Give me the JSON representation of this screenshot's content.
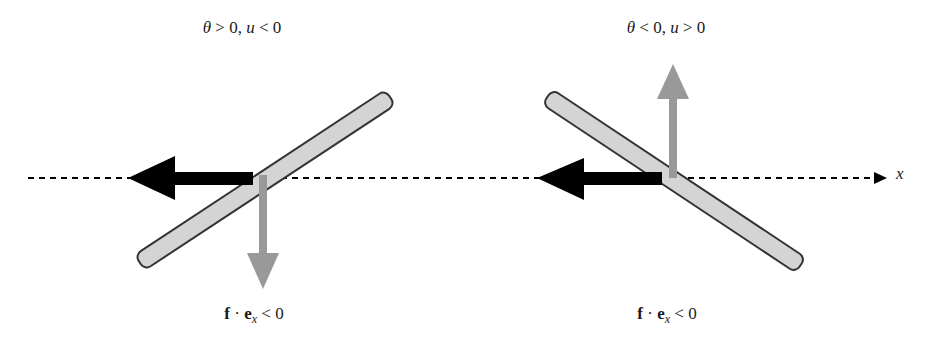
{
  "panels": [
    {
      "id": "left",
      "top_label": {
        "theta": "θ",
        "theta_rel": " > 0, ",
        "u": "u",
        "u_rel": " < 0"
      },
      "bottom_label": {
        "f": "f",
        "dot": " · ",
        "e": "e",
        "sub": "x",
        "rel": " < 0"
      }
    },
    {
      "id": "right",
      "top_label": {
        "theta": "θ",
        "theta_rel": " < 0, ",
        "u": "u",
        "u_rel": " > 0"
      },
      "bottom_label": {
        "f": "f",
        "dot": " · ",
        "e": "e",
        "sub": "x",
        "rel": " < 0"
      }
    }
  ],
  "axis": {
    "label": "x"
  },
  "colors": {
    "plate_fill": "#d4d4d4",
    "plate_stroke": "#333333",
    "force_arrow": "#000000",
    "velocity_arrow": "#999999",
    "axis": "#000000"
  }
}
